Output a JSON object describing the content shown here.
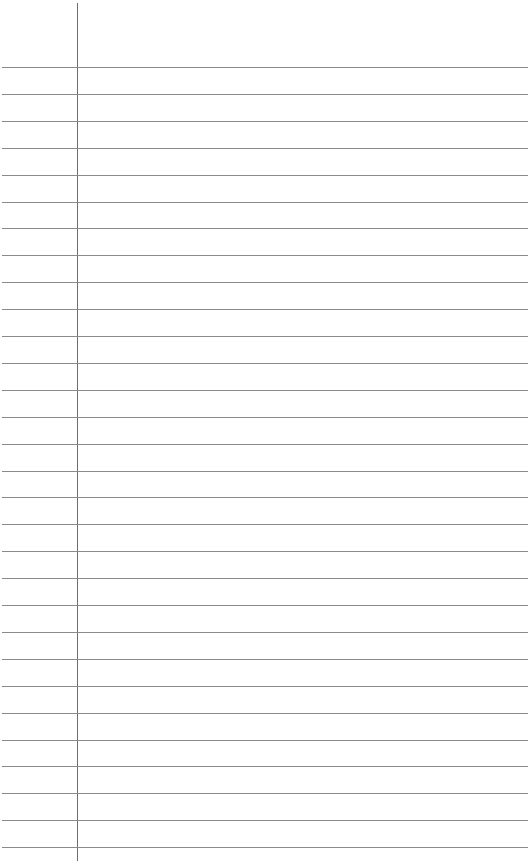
{
  "paper": {
    "type": "lined-paper",
    "line_count": 30,
    "first_line_y": 67,
    "line_spacing": 26.9,
    "rule_color": "#8a8a8a",
    "margin_color": "#6e6e6e",
    "margin_x": 77
  }
}
